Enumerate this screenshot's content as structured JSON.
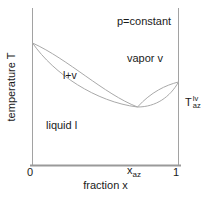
{
  "diagram": {
    "annotation": "p=constant",
    "y_axis_label": "temperature T",
    "x_axis_label": "fraction x",
    "region_labels": {
      "two_phase": "l+v",
      "vapor": "vapor v",
      "liquid": "liquid l"
    },
    "x_ticks": {
      "left": "0",
      "right": "1",
      "azeotrope_base": "x",
      "azeotrope_sub": "az"
    },
    "azeotrope_temp_label": {
      "base": "T",
      "sup": "lv",
      "sub": "az"
    }
  },
  "colors": {
    "background": "#ffffff",
    "curve_line": "#a9a9a9",
    "axis_line": "#a2a2a2",
    "bottom_axis_line": "#9a9a9a",
    "text": "#1a1a1a"
  },
  "curves": {
    "dew_left": "M 32.5,43 C 68,59 104,94 137.5,107",
    "bubble_left": "M 32.5,43 C 54,74 96,102 137.5,107",
    "dew_right": "M 137.5,107 C 151,92 166,85 178.5,82",
    "bubble_right": "M 137.5,107 C 156,107 170,97 178.5,82"
  }
}
